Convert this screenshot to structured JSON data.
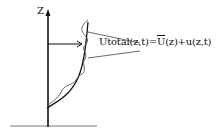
{
  "diagram": {
    "axis_label": "Z",
    "equation": {
      "prefix": "Utotal(z,t)=",
      "mean_symbol": "U",
      "mean_suffix": "(z)+u(z,t)"
    },
    "elements": [
      "vertical z-axis with arrow",
      "ground line",
      "mean velocity profile curve",
      "fluctuating instantaneous velocity curve",
      "horizontal velocity arrow",
      "leader lines to equation"
    ],
    "colors": {
      "line": "#111111",
      "fluct": "#555555",
      "ground": "#666666"
    }
  }
}
